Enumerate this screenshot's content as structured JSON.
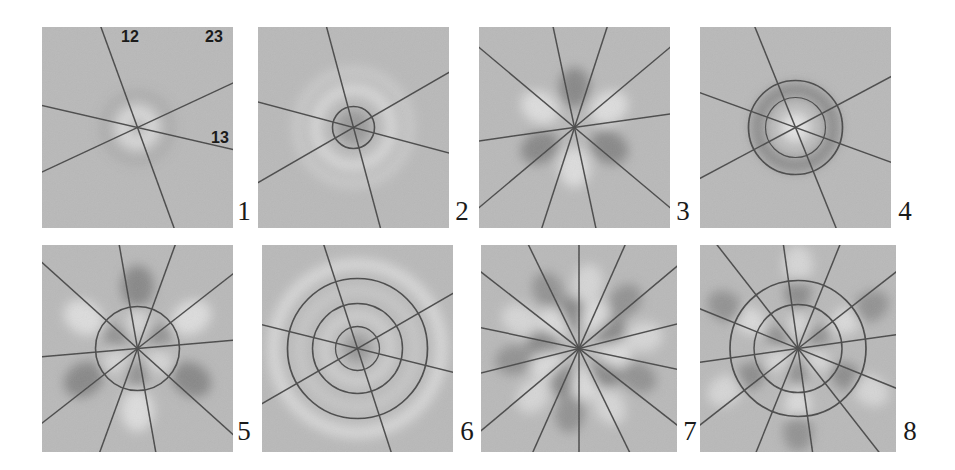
{
  "figure": {
    "background": "#ffffff",
    "panel_background": "#b9b9b9",
    "line_color": "#4a4a4a",
    "dark_lobe_color": "#6b6b6b",
    "light_lobe_color": "#f2f2f2",
    "width": 955,
    "height": 470
  },
  "axis_labels": [
    {
      "text": "12",
      "x": 121,
      "y": 29
    },
    {
      "text": "23",
      "x": 205,
      "y": 29
    },
    {
      "text": "13",
      "x": 211,
      "y": 130
    }
  ],
  "panels": [
    {
      "number": "1",
      "x": 42,
      "y": 27,
      "w": 191,
      "h": 201,
      "label_x": 232,
      "label_y": 198,
      "n_lines": 3,
      "line_angles": [
        -70,
        25,
        -13
      ],
      "circles": [],
      "rings": [
        {
          "radius": 16,
          "lobes": 0,
          "polarity": "light",
          "spread": 14,
          "strength": 0.55
        },
        {
          "radius": 30,
          "lobes": 0,
          "polarity": "dark",
          "spread": 18,
          "strength": 0.14
        }
      ],
      "description": "faint central bright halo, no nodal structure"
    },
    {
      "number": "2",
      "x": 258,
      "y": 27,
      "w": 191,
      "h": 201,
      "label_x": 450,
      "label_y": 198,
      "n_lines": 3,
      "line_angles": [
        -75,
        30,
        -15
      ],
      "circles": [
        {
          "radius": 21,
          "stroke": 1.6
        }
      ],
      "rings": [
        {
          "radius": 0,
          "lobes": 0,
          "polarity": "dark",
          "spread": 17,
          "strength": 0.42
        },
        {
          "radius": 38,
          "lobes": 0,
          "polarity": "light",
          "spread": 11,
          "strength": 0.55
        },
        {
          "radius": 56,
          "lobes": 0,
          "polarity": "light",
          "spread": 10,
          "strength": 0.3
        }
      ],
      "description": "dark core with concentric bright rings"
    },
    {
      "number": "3",
      "x": 479,
      "y": 27,
      "w": 191,
      "h": 201,
      "label_x": 671,
      "label_y": 198,
      "n_lines": 5,
      "line_angles": [
        -78,
        -40,
        8,
        40,
        72
      ],
      "circles": [],
      "rings": [
        {
          "radius": 40,
          "lobes": 6,
          "polarity": "alternating",
          "phase": 90,
          "spread": 19,
          "strength": 0.62
        }
      ],
      "description": "six alternating dark/bright lobes"
    },
    {
      "number": "4",
      "x": 700,
      "y": 27,
      "w": 191,
      "h": 201,
      "label_x": 893,
      "label_y": 198,
      "n_lines": 3,
      "line_angles": [
        -68,
        28,
        -20
      ],
      "circles": [
        {
          "radius": 47,
          "stroke": 1.7
        },
        {
          "radius": 30,
          "stroke": 1.2
        }
      ],
      "rings": [
        {
          "radius": 38,
          "lobes": 0,
          "polarity": "dark",
          "spread": 13,
          "strength": 0.6
        },
        {
          "radius": 0,
          "lobes": 0,
          "polarity": "light",
          "spread": 15,
          "strength": 0.75
        }
      ],
      "description": "thick dark annulus around a bright core"
    },
    {
      "number": "5",
      "x": 42,
      "y": 245,
      "w": 191,
      "h": 207,
      "label_x": 232,
      "label_y": 418,
      "n_lines": 5,
      "line_angles": [
        -80,
        -42,
        5,
        38,
        70
      ],
      "circles": [
        {
          "radius": 42,
          "stroke": 1.6
        }
      ],
      "rings": [
        {
          "radius": 26,
          "lobes": 6,
          "polarity": "alternating",
          "phase": 30,
          "spread": 13,
          "strength": 0.48
        },
        {
          "radius": 62,
          "lobes": 6,
          "polarity": "alternating",
          "phase": 90,
          "spread": 20,
          "strength": 0.62
        }
      ],
      "description": "inner and outer six-lobe rings separated by a circle"
    },
    {
      "number": "6",
      "x": 262,
      "y": 245,
      "w": 191,
      "h": 207,
      "label_x": 455,
      "label_y": 418,
      "n_lines": 3,
      "line_angles": [
        -72,
        30,
        -14
      ],
      "circles": [
        {
          "radius": 70,
          "stroke": 1.7
        },
        {
          "radius": 45,
          "stroke": 1.5
        },
        {
          "radius": 22,
          "stroke": 1.3
        }
      ],
      "rings": [
        {
          "radius": 0,
          "lobes": 0,
          "polarity": "dark",
          "spread": 13,
          "strength": 0.45
        },
        {
          "radius": 33,
          "lobes": 0,
          "polarity": "light",
          "spread": 10,
          "strength": 0.4
        },
        {
          "radius": 58,
          "lobes": 0,
          "polarity": "light",
          "spread": 10,
          "strength": 0.28
        },
        {
          "radius": 84,
          "lobes": 0,
          "polarity": "light",
          "spread": 12,
          "strength": 0.55
        }
      ],
      "description": "three concentric node circles with bright rings"
    },
    {
      "number": "7",
      "x": 481,
      "y": 245,
      "w": 196,
      "h": 207,
      "label_x": 678,
      "label_y": 418,
      "n_lines": 7,
      "line_angles": [
        -90,
        -64,
        -38,
        -12,
        14,
        40,
        66
      ],
      "circles": [],
      "rings": [
        {
          "radius": 36,
          "lobes": 10,
          "polarity": "alternating",
          "phase": 100,
          "spread": 16,
          "strength": 0.6
        },
        {
          "radius": 66,
          "lobes": 10,
          "polarity": "alternating",
          "phase": 118,
          "spread": 18,
          "strength": 0.5
        }
      ],
      "description": "ten alternating lobes in two radial shells"
    },
    {
      "number": "8",
      "x": 700,
      "y": 245,
      "w": 196,
      "h": 207,
      "label_x": 898,
      "label_y": 418,
      "n_lines": 6,
      "line_angles": [
        -82,
        -52,
        -22,
        8,
        38,
        68
      ],
      "circles": [
        {
          "radius": 68,
          "stroke": 1.7
        },
        {
          "radius": 44,
          "stroke": 1.5
        }
      ],
      "rings": [
        {
          "radius": 24,
          "lobes": 6,
          "polarity": "alternating",
          "phase": 30,
          "spread": 12,
          "strength": 0.52
        },
        {
          "radius": 56,
          "lobes": 6,
          "polarity": "alternating",
          "phase": 90,
          "spread": 16,
          "strength": 0.58
        },
        {
          "radius": 84,
          "lobes": 6,
          "polarity": "alternating",
          "phase": 30,
          "spread": 18,
          "strength": 0.5
        }
      ],
      "description": "three concentric six-lobe shells inside two circles"
    }
  ]
}
